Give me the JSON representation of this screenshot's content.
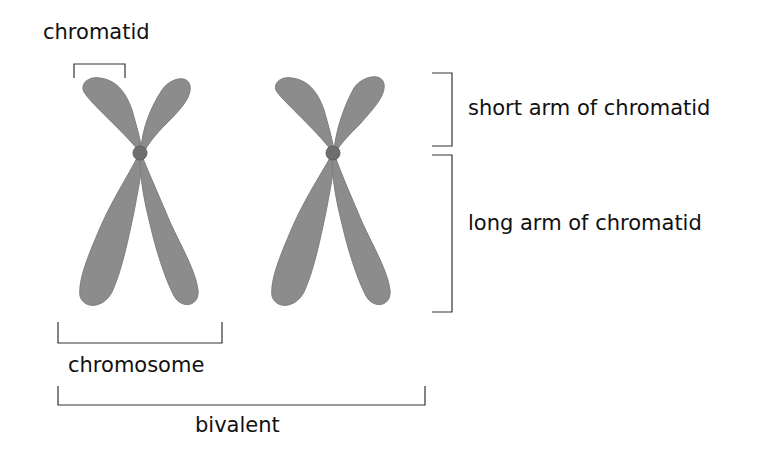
{
  "labels": {
    "chromatid": "chromatid",
    "short_arm": "short arm of chromatid",
    "long_arm": "long arm of chromatid",
    "chromosome": "chromosome",
    "bivalent": "bivalent"
  },
  "colors": {
    "chromatid_fill": "#8c8c8c",
    "chromatid_edge": "#7a7a7a",
    "centromere": "#6a6a6a",
    "bracket": "#333333",
    "text": "#111111"
  }
}
